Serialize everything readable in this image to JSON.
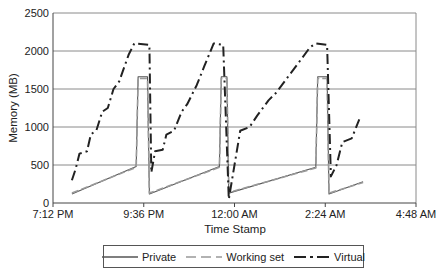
{
  "chart_data": {
    "type": "line",
    "title": "",
    "xlabel": "Time Stamp",
    "ylabel": "Memory (MB)",
    "ylim": [
      0,
      2500
    ],
    "yticks": [
      0,
      500,
      1000,
      1500,
      2000,
      2500
    ],
    "xtick_labels": [
      "7:12 PM",
      "9:36 PM",
      "12:00 AM",
      "2:24 AM",
      "4:48 AM"
    ],
    "x_unit": "hours since 7:12 PM",
    "xlim": [
      0,
      9.6
    ],
    "grid": "horizontal",
    "legend_position": "bottom",
    "series": [
      {
        "name": "Private",
        "style": "solid",
        "color": "#555555",
        "points": [
          [
            0.5,
            120
          ],
          [
            2.2,
            480
          ],
          [
            2.25,
            1660
          ],
          [
            2.5,
            1660
          ],
          [
            2.55,
            120
          ],
          [
            4.4,
            480
          ],
          [
            4.45,
            1660
          ],
          [
            4.6,
            1660
          ],
          [
            4.65,
            130
          ],
          [
            6.95,
            470
          ],
          [
            7.0,
            1660
          ],
          [
            7.25,
            1660
          ],
          [
            7.3,
            120
          ],
          [
            8.2,
            280
          ]
        ]
      },
      {
        "name": "Working set",
        "style": "dashed",
        "color": "#999999",
        "points": [
          [
            0.5,
            130
          ],
          [
            2.2,
            470
          ],
          [
            2.25,
            1640
          ],
          [
            2.5,
            1640
          ],
          [
            2.55,
            130
          ],
          [
            4.4,
            470
          ],
          [
            4.45,
            1640
          ],
          [
            4.6,
            1640
          ],
          [
            4.65,
            140
          ],
          [
            6.95,
            460
          ],
          [
            7.0,
            1640
          ],
          [
            7.25,
            1640
          ],
          [
            7.3,
            130
          ],
          [
            8.2,
            270
          ]
        ]
      },
      {
        "name": "Virtual",
        "style": "dash-dot",
        "color": "#222222",
        "points": [
          [
            0.5,
            300
          ],
          [
            0.6,
            450
          ],
          [
            0.7,
            650
          ],
          [
            0.9,
            680
          ],
          [
            1.0,
            900
          ],
          [
            1.15,
            960
          ],
          [
            1.3,
            1200
          ],
          [
            1.45,
            1250
          ],
          [
            1.6,
            1500
          ],
          [
            1.75,
            1600
          ],
          [
            2.0,
            1950
          ],
          [
            2.15,
            2100
          ],
          [
            2.55,
            2080
          ],
          [
            2.6,
            400
          ],
          [
            2.7,
            680
          ],
          [
            2.9,
            700
          ],
          [
            3.0,
            900
          ],
          [
            3.2,
            950
          ],
          [
            3.4,
            1200
          ],
          [
            3.55,
            1300
          ],
          [
            3.8,
            1550
          ],
          [
            4.0,
            1800
          ],
          [
            4.25,
            2100
          ],
          [
            4.5,
            2080
          ],
          [
            4.65,
            50
          ],
          [
            4.8,
            500
          ],
          [
            4.95,
            950
          ],
          [
            5.2,
            1000
          ],
          [
            5.4,
            1150
          ],
          [
            5.7,
            1350
          ],
          [
            5.9,
            1450
          ],
          [
            6.2,
            1650
          ],
          [
            6.5,
            1850
          ],
          [
            6.8,
            2050
          ],
          [
            6.95,
            2100
          ],
          [
            7.25,
            2080
          ],
          [
            7.35,
            350
          ],
          [
            7.5,
            500
          ],
          [
            7.65,
            800
          ],
          [
            7.9,
            850
          ],
          [
            8.1,
            1100
          ]
        ]
      }
    ]
  },
  "legend": {
    "items": [
      {
        "label": "Private",
        "style": "solid"
      },
      {
        "label": "Working set",
        "style": "dashed"
      },
      {
        "label": "Virtual",
        "style": "dash-dot"
      }
    ]
  }
}
